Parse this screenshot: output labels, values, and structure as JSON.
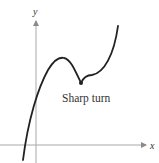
{
  "figure": {
    "axes": {
      "x_label": "x",
      "y_label": "y",
      "axis_color": "#9a9a9a"
    },
    "curve": {
      "color": "#222222",
      "description": "Continuous curve rising from below x-axis to a local max, dropping to a sharp turn (non-differentiable cusp point), then rising steeply"
    },
    "annotation": {
      "text": "Sharp turn",
      "marker": "point"
    }
  }
}
